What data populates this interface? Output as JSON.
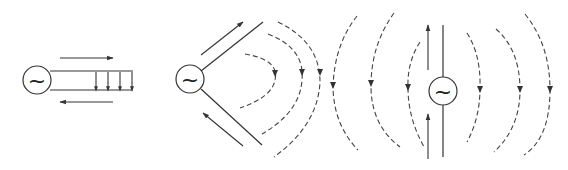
{
  "diagram": {
    "title": "",
    "panels": [
      {
        "id": "transmission-line",
        "description": "AC source feeding parallel two-wire line; current arrows opposite on each conductor; field arrows between wires pointing down",
        "source_symbol": "~",
        "field_arrows_count": 4
      },
      {
        "id": "flaring-line",
        "description": "Two wires splayed apart in V shape from AC source; dashed field lines begin detaching",
        "source_symbol": "~",
        "dashed_field_lines": 3
      },
      {
        "id": "dipole-radiation",
        "description": "Wires straightened into dipole antenna; closed dashed field loops radiate outward on both sides",
        "source_symbol": "~",
        "dashed_field_lines_left": 3,
        "dashed_field_lines_right": 3
      }
    ],
    "colors": {
      "line": "#333333",
      "background": "#ffffff"
    }
  }
}
